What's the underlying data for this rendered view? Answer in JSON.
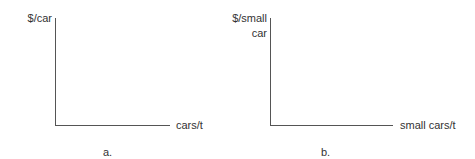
{
  "panels": [
    {
      "id": "a",
      "y_axis_label": "$/car",
      "y_axis_label_lines": [
        "$/car"
      ],
      "x_axis_label": "cars/t",
      "caption": "a."
    },
    {
      "id": "b",
      "y_axis_label": "$/small car",
      "y_axis_label_lines": [
        "$/small",
        "car"
      ],
      "x_axis_label": "small cars/t",
      "caption": "b."
    }
  ],
  "colors": {
    "axis": "#555555",
    "text": "#333333",
    "background": "#ffffff"
  }
}
